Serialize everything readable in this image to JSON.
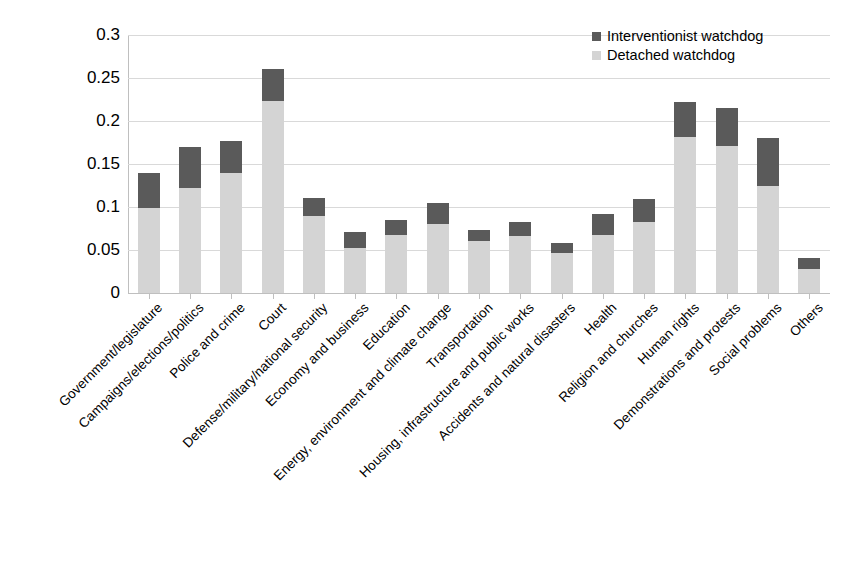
{
  "chart_data": {
    "type": "bar",
    "subtype": "stacked-vertical",
    "title": "",
    "xlabel": "",
    "ylabel": "",
    "ylim": [
      0,
      0.3
    ],
    "ytick_labels": [
      "0.3",
      "0.25",
      "0.2",
      "0.15",
      "0.1",
      "0.05",
      "0"
    ],
    "ytick_values": [
      0.3,
      0.25,
      0.2,
      0.15,
      0.1,
      0.05,
      0
    ],
    "grid": true,
    "legend_position": "top-right",
    "categories": [
      "Government/legislature",
      "Campaigns/elections/politics",
      "Police and crime",
      "Court",
      "Defense/military/national security",
      "Economy and business",
      "Education",
      "Energy, environment and climate change",
      "Transportation",
      "Housing, infrastructure and public works",
      "Accidents and natural disasters",
      "Health",
      "Religion and churches",
      "Human rights",
      "Demonstrations and protests",
      "Social problems",
      "Others"
    ],
    "series": [
      {
        "name": "Detached watchdog",
        "color": "#d4d4d4",
        "values": [
          0.099,
          0.122,
          0.139,
          0.223,
          0.089,
          0.052,
          0.068,
          0.08,
          0.06,
          0.066,
          0.046,
          0.068,
          0.083,
          0.181,
          0.171,
          0.124,
          0.028
        ]
      },
      {
        "name": "Interventionist watchdog",
        "color": "#5a5a5a",
        "values": [
          0.041,
          0.048,
          0.038,
          0.037,
          0.022,
          0.019,
          0.017,
          0.025,
          0.013,
          0.017,
          0.012,
          0.024,
          0.026,
          0.041,
          0.044,
          0.056,
          0.013
        ]
      }
    ],
    "totals": [
      0.14,
      0.17,
      0.177,
      0.26,
      0.111,
      0.071,
      0.085,
      0.105,
      0.073,
      0.083,
      0.058,
      0.092,
      0.109,
      0.222,
      0.215,
      0.18,
      0.041
    ]
  },
  "legend": {
    "items": [
      {
        "label": "Interventionist watchdog",
        "swatch": "dark"
      },
      {
        "label": "Detached watchdog",
        "swatch": "light"
      }
    ]
  },
  "colors": {
    "interventionist": "#5a5a5a",
    "detached": "#d4d4d4",
    "gridline": "#d9d9d9",
    "axis": "#bfbfbf",
    "background": "#ffffff"
  }
}
